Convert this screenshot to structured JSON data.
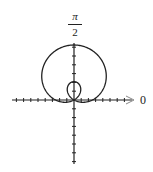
{
  "chart_data": {
    "type": "line",
    "subtype": "polar",
    "title": "",
    "curve": "limaçon with inner loop, r = 1 + 2 sin θ",
    "equation_estimate": {
      "a": 1,
      "b": 2,
      "form": "r = a + b sin(theta)"
    },
    "max_r": 3,
    "inner_loop_r": 1,
    "axis_labels": {
      "polar_axis": "0",
      "vertical_axis_num": "π",
      "vertical_axis_den": "2"
    },
    "grid": false,
    "ticks": {
      "horizontal_each_side": 8,
      "vertical_up": 6,
      "vertical_down": 7
    },
    "colors": {
      "curve": "#222222",
      "axes": "#222222",
      "arrow": "#888888"
    }
  }
}
